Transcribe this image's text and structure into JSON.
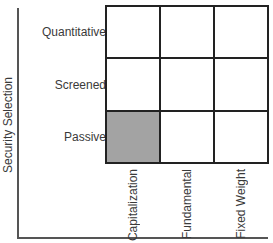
{
  "diagram": {
    "y_axis_title": "Security Selection",
    "rows": [
      {
        "label": "Quantitative",
        "cells": [
          false,
          false,
          false
        ]
      },
      {
        "label": "Screened",
        "cells": [
          false,
          false,
          false
        ]
      },
      {
        "label": "Passive",
        "cells": [
          true,
          false,
          false
        ]
      }
    ],
    "columns": [
      "Capitalization",
      "Fundamental",
      "Fixed Weight"
    ],
    "colors": {
      "filled_cell": "#a3a3a3",
      "grid_line": "#222222",
      "axis_line": "#555555",
      "text": "#3a3a3a"
    }
  }
}
